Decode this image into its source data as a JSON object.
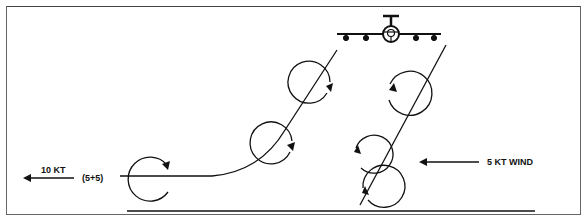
{
  "diagram": {
    "type": "wake-vortex-drift",
    "labels": {
      "left_wind_speed": "10 KT",
      "left_wind_breakdown": "(5+5)",
      "right_wind": "5 KT WIND"
    },
    "elements": {
      "aircraft": "aircraft-front-view-icon",
      "left_vortex_path": "curving trail drifting left",
      "right_vortex_path": "straight trail descending",
      "ground_line": "horizontal baseline"
    },
    "colors": {
      "stroke": "#111111",
      "background": "#ffffff",
      "frame": "#666666"
    }
  }
}
